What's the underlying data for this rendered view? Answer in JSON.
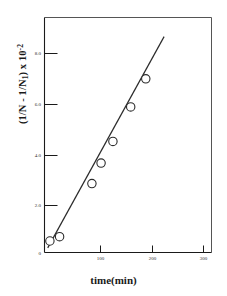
{
  "chart_data": {
    "type": "scatter",
    "title": "",
    "subtitle": "",
    "xlabel": "time(min)",
    "ylabel_parts": {
      "pre": "(1/N - 1/N",
      "sub": "1",
      "mid": ") x 10",
      "sup": "-2"
    },
    "ylabel": "(1/N - 1/N1) x 10-2",
    "xlim": [
      0,
      310
    ],
    "ylim": [
      0,
      9.2
    ],
    "xticks": [
      100,
      200,
      300
    ],
    "xticklabels": [
      "100",
      "200",
      "300"
    ],
    "yticks": [
      2.0,
      4.0,
      6.0,
      8.0
    ],
    "yticklabels": [
      "2.0",
      "4.0",
      "6.0",
      "8.0"
    ],
    "grid": false,
    "legend": false,
    "legend_position": "none",
    "marker": "open-circle",
    "series": [
      {
        "name": "data",
        "x": [
          10,
          28,
          88,
          105,
          127,
          160,
          188
        ],
        "y": [
          0.45,
          0.62,
          2.7,
          3.5,
          4.35,
          5.7,
          6.8
        ]
      }
    ],
    "fit_line": {
      "name": "linear-fit",
      "x_start": 6,
      "y_start": 0.18,
      "x_end": 222,
      "y_end": 8.45
    },
    "colors": {
      "axis": "#1a1a1a",
      "marker": "#2b2b2b",
      "line": "#2b2b2b",
      "background": "#ffffff"
    }
  },
  "figure": {
    "alt": "Scatter plot of (1/N - 1/N1) x 10^-2 versus time in minutes with linear fit"
  }
}
